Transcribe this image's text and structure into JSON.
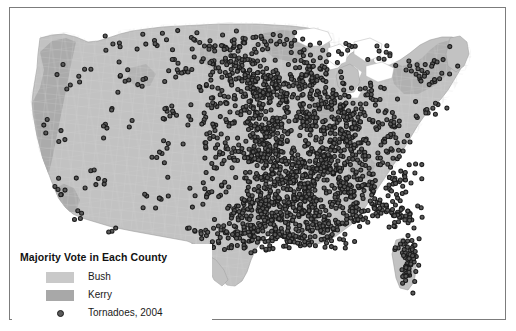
{
  "figure": {
    "background_color": "#ffffff",
    "border_color": "#7c7c7c"
  },
  "legend": {
    "title": "Majority Vote in Each County",
    "items": [
      {
        "label": "Bush",
        "type": "swatch",
        "color": "#c9c9c9"
      },
      {
        "label": "Kerry",
        "type": "swatch",
        "color": "#a8a8a8"
      },
      {
        "label": "Tornadoes, 2004",
        "type": "marker",
        "color": "#5a5a5a",
        "edge_color": "#1b1b1b"
      }
    ]
  },
  "chart_data": {
    "type": "map",
    "title": "Majority Vote in Each County",
    "subtitle": "",
    "projection": "albers-usa",
    "region": "Contiguous United States, by county",
    "grid": false,
    "legend_position": "lower-left",
    "xlabel": "",
    "ylabel": "",
    "layers": [
      {
        "name": "county-choropleth",
        "kind": "choropleth",
        "categories": [
          "Bush",
          "Kerry"
        ],
        "colors": {
          "Bush": "#c9c9c9",
          "Kerry": "#a8a8a8"
        },
        "boundary_color": "#d4d4d4",
        "description": "US counties shaded by 2004 presidential majority vote"
      },
      {
        "name": "tornadoes-2004",
        "kind": "point-overlay",
        "label": "Tornadoes, 2004",
        "marker": "circle",
        "marker_face_color": "#5a5a5a",
        "marker_edge_color": "#1b1b1b",
        "marker_size_px": 4,
        "count_approx": 1800,
        "density_notes": "Highest concentration across the Great Plains, Mississippi Valley, Gulf Coast and Florida; sparse in the Mountain West and Great Basin"
      }
    ]
  }
}
